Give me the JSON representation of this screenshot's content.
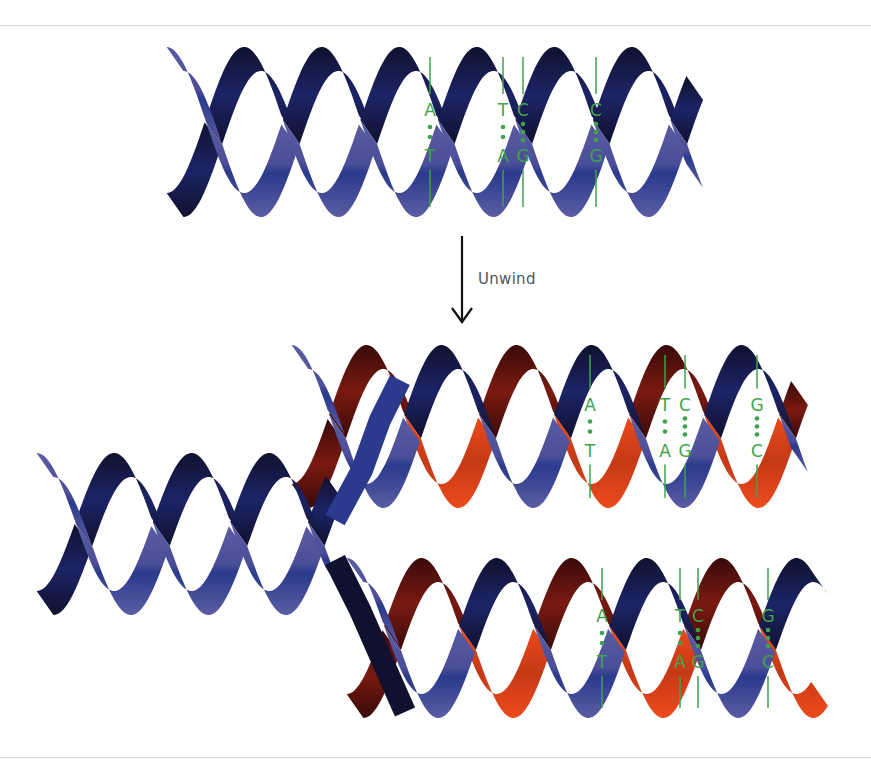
{
  "diagram": {
    "colors": {
      "blue_light": "#5b5da3",
      "blue_mid": "#2b3a8c",
      "blue_dark": "#10112e",
      "red_light": "#ee4a1c",
      "red_dark": "#3a0a0a",
      "base_pair_green": "#3fa34d",
      "arrow": "#111111",
      "label_text": "#555555",
      "rule": "#d6d6d6"
    },
    "arrow": {
      "label": "Unwind",
      "x": 462,
      "y1": 236,
      "y2": 322,
      "label_x": 478,
      "label_y": 270
    },
    "helices": [
      {
        "name": "parent-helix",
        "x_start": 175,
        "x_end": 695,
        "y_top": 47,
        "y_bottom": 217,
        "period": 155,
        "phase": 0,
        "strand_a_color": "blue",
        "strand_b_color": "blue",
        "width": 24,
        "base_pairs": [
          {
            "x": 430,
            "top": "A",
            "bottom": "T"
          },
          {
            "x": 503,
            "top": "T",
            "bottom": "A"
          },
          {
            "x": 523,
            "top": "C",
            "bottom": "G"
          },
          {
            "x": 596,
            "top": "C",
            "bottom": "G"
          }
        ]
      },
      {
        "name": "daughter-helix-upper",
        "x_start": 300,
        "x_end": 800,
        "y_top": 345,
        "y_bottom": 508,
        "period": 150,
        "phase": 0.5,
        "strand_a_color": "red",
        "strand_b_color": "blue",
        "width": 24,
        "base_pairs": [
          {
            "x": 590,
            "top": "A",
            "bottom": "T"
          },
          {
            "x": 665,
            "top": "T",
            "bottom": "A"
          },
          {
            "x": 685,
            "top": "C",
            "bottom": "G"
          },
          {
            "x": 757,
            "top": "G",
            "bottom": "C"
          }
        ]
      },
      {
        "name": "daughter-helix-lower",
        "x_start": 355,
        "x_end": 820,
        "y_top": 558,
        "y_bottom": 718,
        "period": 150,
        "phase": 0.5,
        "strand_a_color": "red",
        "strand_b_color": "blue",
        "width": 24,
        "base_pairs": [
          {
            "x": 602,
            "top": "A",
            "bottom": "T"
          },
          {
            "x": 680,
            "top": "T",
            "bottom": "A"
          },
          {
            "x": 698,
            "top": "C",
            "bottom": "G"
          },
          {
            "x": 768,
            "top": "G",
            "bottom": "C"
          }
        ]
      },
      {
        "name": "unwound-parent-helix",
        "x_start": 45,
        "x_end": 335,
        "y_top": 453,
        "y_bottom": 615,
        "period": 155,
        "phase": 0,
        "strand_a_color": "blue",
        "strand_b_color": "blue",
        "width": 24,
        "base_pairs": []
      }
    ],
    "fork": {
      "upper_strand": [
        [
          335,
          520
        ],
        [
          362,
          470
        ],
        [
          380,
          420
        ],
        [
          400,
          380
        ]
      ],
      "lower_strand": [
        [
          335,
          560
        ],
        [
          360,
          610
        ],
        [
          382,
          660
        ],
        [
          405,
          712
        ]
      ]
    }
  }
}
